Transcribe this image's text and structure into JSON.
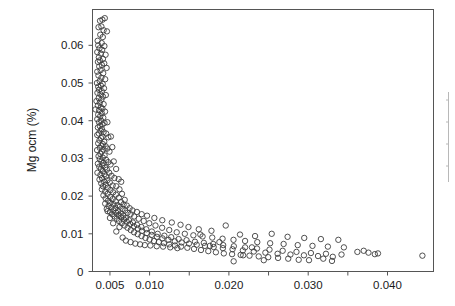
{
  "chart_data": {
    "type": "scatter",
    "title": "",
    "xlabel": "",
    "ylabel": "Mg ocm (%)",
    "xlim": [
      0.0028,
      0.0458
    ],
    "ylim": [
      0,
      0.0695
    ],
    "grid": false,
    "legend": null,
    "marker": "open-circle",
    "marker_color": "#3d3d3d",
    "marker_size_px": 5.4,
    "xticks": [
      0.005,
      0.01,
      0.015,
      0.02,
      0.025,
      0.03,
      0.035,
      0.04
    ],
    "xticklabels": [
      "0.005",
      "0.010",
      "",
      "0.020",
      "",
      "0.030",
      "",
      "0.040"
    ],
    "yticks": [
      0,
      0.01,
      0.02,
      0.03,
      0.04,
      0.05,
      0.06
    ],
    "yticklabels": [
      "0",
      "0.01",
      "0.02",
      "0.03",
      "0.04",
      "0.05",
      "0.06"
    ],
    "points": [
      [
        0.00375,
        0.0665
      ],
      [
        0.00405,
        0.0668
      ],
      [
        0.00435,
        0.0672
      ],
      [
        0.00392,
        0.065
      ],
      [
        0.00356,
        0.0648
      ],
      [
        0.0042,
        0.064
      ],
      [
        0.00462,
        0.0637
      ],
      [
        0.00378,
        0.0628
      ],
      [
        0.0041,
        0.0622
      ],
      [
        0.00345,
        0.0612
      ],
      [
        0.00396,
        0.0606
      ],
      [
        0.00352,
        0.06
      ],
      [
        0.0043,
        0.0598
      ],
      [
        0.00368,
        0.0592
      ],
      [
        0.00402,
        0.0588
      ],
      [
        0.0034,
        0.0582
      ],
      [
        0.00385,
        0.0578
      ],
      [
        0.00445,
        0.0575
      ],
      [
        0.0036,
        0.0568
      ],
      [
        0.00412,
        0.0564
      ],
      [
        0.00372,
        0.056
      ],
      [
        0.00348,
        0.0556
      ],
      [
        0.00428,
        0.0552
      ],
      [
        0.00398,
        0.0548
      ],
      [
        0.00365,
        0.0544
      ],
      [
        0.00458,
        0.054
      ],
      [
        0.00382,
        0.0534
      ],
      [
        0.0034,
        0.053
      ],
      [
        0.00415,
        0.0526
      ],
      [
        0.00355,
        0.052
      ],
      [
        0.00392,
        0.0514
      ],
      [
        0.0044,
        0.051
      ],
      [
        0.0037,
        0.0505
      ],
      [
        0.00336,
        0.05
      ],
      [
        0.00408,
        0.0498
      ],
      [
        0.00386,
        0.0493
      ],
      [
        0.00352,
        0.049
      ],
      [
        0.00425,
        0.0486
      ],
      [
        0.00362,
        0.0482
      ],
      [
        0.00398,
        0.0478
      ],
      [
        0.00342,
        0.0474
      ],
      [
        0.0038,
        0.047
      ],
      [
        0.00448,
        0.0468
      ],
      [
        0.00412,
        0.0464
      ],
      [
        0.00358,
        0.046
      ],
      [
        0.00392,
        0.0456
      ],
      [
        0.0033,
        0.0452
      ],
      [
        0.00372,
        0.0448
      ],
      [
        0.0042,
        0.0444
      ],
      [
        0.00348,
        0.044
      ],
      [
        0.00385,
        0.0436
      ],
      [
        0.00405,
        0.0432
      ],
      [
        0.00364,
        0.0428
      ],
      [
        0.00438,
        0.0424
      ],
      [
        0.00318,
        0.043
      ],
      [
        0.00396,
        0.042
      ],
      [
        0.00352,
        0.0416
      ],
      [
        0.00378,
        0.0412
      ],
      [
        0.00416,
        0.0408
      ],
      [
        0.0034,
        0.0404
      ],
      [
        0.0039,
        0.04
      ],
      [
        0.00362,
        0.0396
      ],
      [
        0.00432,
        0.0394
      ],
      [
        0.00404,
        0.039
      ],
      [
        0.00372,
        0.0386
      ],
      [
        0.00468,
        0.0396
      ],
      [
        0.00348,
        0.0382
      ],
      [
        0.00398,
        0.0378
      ],
      [
        0.00382,
        0.0374
      ],
      [
        0.0042,
        0.037
      ],
      [
        0.0036,
        0.0366
      ],
      [
        0.0034,
        0.0362
      ],
      [
        0.00406,
        0.0358
      ],
      [
        0.00452,
        0.0366
      ],
      [
        0.00388,
        0.0354
      ],
      [
        0.00368,
        0.0348
      ],
      [
        0.00428,
        0.0344
      ],
      [
        0.0041,
        0.0338
      ],
      [
        0.0048,
        0.0356
      ],
      [
        0.00352,
        0.034
      ],
      [
        0.00392,
        0.0334
      ],
      [
        0.00446,
        0.0332
      ],
      [
        0.00372,
        0.0328
      ],
      [
        0.00512,
        0.0358
      ],
      [
        0.00418,
        0.0324
      ],
      [
        0.00338,
        0.0322
      ],
      [
        0.00398,
        0.0318
      ],
      [
        0.00466,
        0.0326
      ],
      [
        0.0038,
        0.0312
      ],
      [
        0.00432,
        0.0308
      ],
      [
        0.00356,
        0.0306
      ],
      [
        0.0041,
        0.0302
      ],
      [
        0.00494,
        0.0318
      ],
      [
        0.00372,
        0.0298
      ],
      [
        0.00452,
        0.0296
      ],
      [
        0.00392,
        0.0292
      ],
      [
        0.0053,
        0.033
      ],
      [
        0.0042,
        0.0288
      ],
      [
        0.00348,
        0.0286
      ],
      [
        0.00478,
        0.029
      ],
      [
        0.00405,
        0.0282
      ],
      [
        0.00365,
        0.0278
      ],
      [
        0.0044,
        0.0276
      ],
      [
        0.00386,
        0.0272
      ],
      [
        0.00508,
        0.0284
      ],
      [
        0.00462,
        0.027
      ],
      [
        0.00412,
        0.0266
      ],
      [
        0.00342,
        0.0262
      ],
      [
        0.00548,
        0.0292
      ],
      [
        0.00432,
        0.0258
      ],
      [
        0.0038,
        0.0256
      ],
      [
        0.0049,
        0.0262
      ],
      [
        0.0045,
        0.0252
      ],
      [
        0.004,
        0.0248
      ],
      [
        0.00578,
        0.0272
      ],
      [
        0.0052,
        0.0254
      ],
      [
        0.00368,
        0.0244
      ],
      [
        0.00468,
        0.0242
      ],
      [
        0.00428,
        0.0238
      ],
      [
        0.00556,
        0.0248
      ],
      [
        0.0039,
        0.0234
      ],
      [
        0.00498,
        0.0236
      ],
      [
        0.0061,
        0.0245
      ],
      [
        0.00448,
        0.023
      ],
      [
        0.00412,
        0.0226
      ],
      [
        0.00534,
        0.0228
      ],
      [
        0.00642,
        0.0238
      ],
      [
        0.00472,
        0.0222
      ],
      [
        0.0058,
        0.0226
      ],
      [
        0.00398,
        0.0218
      ],
      [
        0.00506,
        0.0216
      ],
      [
        0.0044,
        0.0212
      ],
      [
        0.0062,
        0.0218
      ],
      [
        0.0054,
        0.021
      ],
      [
        0.0047,
        0.0206
      ],
      [
        0.00418,
        0.0202
      ],
      [
        0.00576,
        0.0204
      ],
      [
        0.00502,
        0.0198
      ],
      [
        0.00652,
        0.0206
      ],
      [
        0.00446,
        0.0194
      ],
      [
        0.00612,
        0.0196
      ],
      [
        0.00534,
        0.0192
      ],
      [
        0.00476,
        0.0188
      ],
      [
        0.00572,
        0.0186
      ],
      [
        0.00504,
        0.0182
      ],
      [
        0.00686,
        0.019
      ],
      [
        0.0044,
        0.018
      ],
      [
        0.0064,
        0.0184
      ],
      [
        0.00546,
        0.0178
      ],
      [
        0.00596,
        0.0176
      ],
      [
        0.00482,
        0.0174
      ],
      [
        0.00672,
        0.0178
      ],
      [
        0.0052,
        0.017
      ],
      [
        0.00624,
        0.0172
      ],
      [
        0.0057,
        0.0168
      ],
      [
        0.00712,
        0.0175
      ],
      [
        0.0046,
        0.0166
      ],
      [
        0.00658,
        0.0166
      ],
      [
        0.00544,
        0.0162
      ],
      [
        0.00604,
        0.016
      ],
      [
        0.005,
        0.0158
      ],
      [
        0.00748,
        0.0168
      ],
      [
        0.00692,
        0.0162
      ],
      [
        0.00578,
        0.0156
      ],
      [
        0.00636,
        0.0154
      ],
      [
        0.00528,
        0.0152
      ],
      [
        0.00784,
        0.0162
      ],
      [
        0.00722,
        0.0156
      ],
      [
        0.00608,
        0.015
      ],
      [
        0.00668,
        0.0148
      ],
      [
        0.00556,
        0.0146
      ],
      [
        0.0084,
        0.0158
      ],
      [
        0.0076,
        0.0152
      ],
      [
        0.00642,
        0.0144
      ],
      [
        0.007,
        0.0142
      ],
      [
        0.00586,
        0.014
      ],
      [
        0.009,
        0.0152
      ],
      [
        0.00806,
        0.0146
      ],
      [
        0.00676,
        0.0138
      ],
      [
        0.0074,
        0.0136
      ],
      [
        0.00614,
        0.0134
      ],
      [
        0.00968,
        0.0148
      ],
      [
        0.00862,
        0.014
      ],
      [
        0.00712,
        0.0132
      ],
      [
        0.0079,
        0.013
      ],
      [
        0.00648,
        0.0128
      ],
      [
        0.0106,
        0.0142
      ],
      [
        0.00926,
        0.0134
      ],
      [
        0.00756,
        0.0126
      ],
      [
        0.0084,
        0.0124
      ],
      [
        0.00684,
        0.0122
      ],
      [
        0.0116,
        0.0136
      ],
      [
        0.00996,
        0.0128
      ],
      [
        0.00802,
        0.012
      ],
      [
        0.00896,
        0.0118
      ],
      [
        0.00722,
        0.0116
      ],
      [
        0.0128,
        0.013
      ],
      [
        0.01074,
        0.0122
      ],
      [
        0.00852,
        0.0114
      ],
      [
        0.00958,
        0.0112
      ],
      [
        0.00762,
        0.011
      ],
      [
        0.0139,
        0.0124
      ],
      [
        0.01158,
        0.0116
      ],
      [
        0.00906,
        0.0108
      ],
      [
        0.01028,
        0.0106
      ],
      [
        0.00804,
        0.0104
      ],
      [
        0.0149,
        0.0118
      ],
      [
        0.01248,
        0.011
      ],
      [
        0.00964,
        0.0102
      ],
      [
        0.01102,
        0.01
      ],
      [
        0.0085,
        0.0099
      ],
      [
        0.0162,
        0.0112
      ],
      [
        0.01342,
        0.0104
      ],
      [
        0.01026,
        0.0097
      ],
      [
        0.01186,
        0.0095
      ],
      [
        0.00898,
        0.0094
      ],
      [
        0.0178,
        0.0108
      ],
      [
        0.01444,
        0.01
      ],
      [
        0.01092,
        0.0092
      ],
      [
        0.01272,
        0.0091
      ],
      [
        0.00948,
        0.0089
      ],
      [
        0.0196,
        0.0122
      ],
      [
        0.01552,
        0.0096
      ],
      [
        0.01162,
        0.0088
      ],
      [
        0.01366,
        0.0086
      ],
      [
        0.01,
        0.0085
      ],
      [
        0.0214,
        0.0098
      ],
      [
        0.01668,
        0.0093
      ],
      [
        0.01238,
        0.0084
      ],
      [
        0.01466,
        0.0083
      ],
      [
        0.01056,
        0.0081
      ],
      [
        0.0233,
        0.0094
      ],
      [
        0.0179,
        0.009
      ],
      [
        0.01318,
        0.008
      ],
      [
        0.01572,
        0.0079
      ],
      [
        0.01116,
        0.0078
      ],
      [
        0.0254,
        0.01
      ],
      [
        0.0192,
        0.0087
      ],
      [
        0.01404,
        0.0077
      ],
      [
        0.01684,
        0.0076
      ],
      [
        0.0118,
        0.0075
      ],
      [
        0.0274,
        0.0092
      ],
      [
        0.02058,
        0.0084
      ],
      [
        0.01496,
        0.0074
      ],
      [
        0.01802,
        0.0073
      ],
      [
        0.01248,
        0.0072
      ],
      [
        0.0295,
        0.0089
      ],
      [
        0.02204,
        0.0081
      ],
      [
        0.01594,
        0.0071
      ],
      [
        0.01928,
        0.007
      ],
      [
        0.0132,
        0.0069
      ],
      [
        0.0316,
        0.0086
      ],
      [
        0.02358,
        0.0078
      ],
      [
        0.01698,
        0.0068
      ],
      [
        0.02062,
        0.0067
      ],
      [
        0.01396,
        0.0066
      ],
      [
        0.0338,
        0.0084
      ],
      [
        0.0252,
        0.0075
      ],
      [
        0.01808,
        0.0065
      ],
      [
        0.02204,
        0.0064
      ],
      [
        0.01476,
        0.0063
      ],
      [
        0.0269,
        0.0073
      ],
      [
        0.01924,
        0.0062
      ],
      [
        0.02354,
        0.0061
      ],
      [
        0.0156,
        0.006
      ],
      [
        0.02868,
        0.007
      ],
      [
        0.02046,
        0.0059
      ],
      [
        0.02512,
        0.0058
      ],
      [
        0.01648,
        0.0057
      ],
      [
        0.03054,
        0.0068
      ],
      [
        0.02176,
        0.0056
      ],
      [
        0.02678,
        0.0055
      ],
      [
        0.0174,
        0.0054
      ],
      [
        0.03248,
        0.0066
      ],
      [
        0.02314,
        0.0053
      ],
      [
        0.02852,
        0.0052
      ],
      [
        0.01836,
        0.0051
      ],
      [
        0.0345,
        0.0064
      ],
      [
        0.0246,
        0.005
      ],
      [
        0.03034,
        0.0049
      ],
      [
        0.01936,
        0.0048
      ],
      [
        0.02614,
        0.0047
      ],
      [
        0.03224,
        0.0047
      ],
      [
        0.0204,
        0.0046
      ],
      [
        0.02776,
        0.0045
      ],
      [
        0.0342,
        0.0045
      ],
      [
        0.02148,
        0.0044
      ],
      [
        0.02946,
        0.0043
      ],
      [
        0.0362,
        0.0052
      ],
      [
        0.0226,
        0.0042
      ],
      [
        0.03124,
        0.0041
      ],
      [
        0.0376,
        0.005
      ],
      [
        0.02376,
        0.004
      ],
      [
        0.0331,
        0.0039
      ],
      [
        0.0388,
        0.0048
      ],
      [
        0.02496,
        0.0038
      ],
      [
        0.0262,
        0.0036
      ],
      [
        0.0319,
        0.0034
      ],
      [
        0.02748,
        0.0034
      ],
      [
        0.0301,
        0.003
      ],
      [
        0.0288,
        0.0031
      ],
      [
        0.0244,
        0.003
      ],
      [
        0.033,
        0.0028
      ],
      [
        0.0218,
        0.0043
      ],
      [
        0.037,
        0.0055
      ],
      [
        0.0384,
        0.0046
      ],
      [
        0.0444,
        0.0042
      ],
      [
        0.0206,
        0.0027
      ],
      [
        0.0176,
        0.0068
      ],
      [
        0.0164,
        0.0098
      ],
      [
        0.0188,
        0.0078
      ],
      [
        0.0229,
        0.0064
      ],
      [
        0.0062,
        0.0118
      ],
      [
        0.0058,
        0.0106
      ],
      [
        0.0066,
        0.009
      ],
      [
        0.007,
        0.0082
      ],
      [
        0.0076,
        0.0078
      ],
      [
        0.0082,
        0.0074
      ],
      [
        0.0088,
        0.0072
      ],
      [
        0.0094,
        0.007
      ],
      [
        0.0101,
        0.0069
      ],
      [
        0.0109,
        0.0067
      ],
      [
        0.0117,
        0.0066
      ],
      [
        0.0126,
        0.0064
      ],
      [
        0.0135,
        0.0062
      ],
      [
        0.0054,
        0.0128
      ],
      [
        0.005,
        0.0142
      ],
      [
        0.0047,
        0.016
      ]
    ]
  },
  "right_panel": {
    "visible": true,
    "note": "cropped adjacent axis edge"
  }
}
